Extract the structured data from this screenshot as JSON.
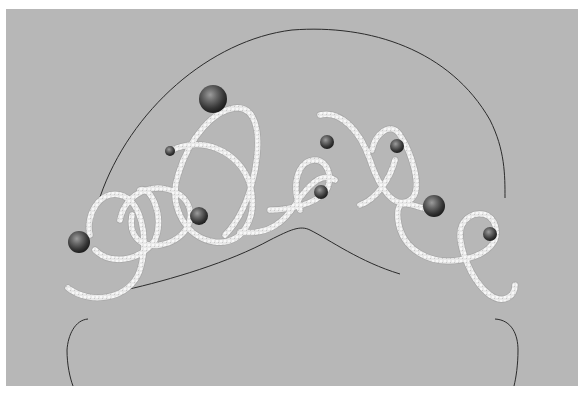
{
  "image": {
    "subject": "tiara illustration",
    "description": "Pearl-studded diamond scroll tiara drawn on a head outline",
    "colors": {
      "page_background": "#ffffff",
      "canvas_background": "#b7b7b7",
      "head_outline": "#2a2a2a",
      "diamond_band": "#e6e6e6",
      "diamond_band_shadow": "#9a9a9a",
      "pearl_dark": "#2e2e2e",
      "pearl_highlight": "#8a8a8a"
    },
    "canvas": {
      "x": 6,
      "y": 9,
      "width": 572,
      "height": 377
    },
    "pearls": [
      {
        "name": "large-top",
        "cx": 213,
        "cy": 99,
        "r": 14
      },
      {
        "name": "small-left-upper",
        "cx": 170,
        "cy": 151,
        "r": 5
      },
      {
        "name": "left-end",
        "cx": 79,
        "cy": 242,
        "r": 11
      },
      {
        "name": "center-left",
        "cx": 199,
        "cy": 216,
        "r": 9
      },
      {
        "name": "center-upper",
        "cx": 327,
        "cy": 142,
        "r": 7
      },
      {
        "name": "right-upper",
        "cx": 397,
        "cy": 146,
        "r": 7
      },
      {
        "name": "center-lower",
        "cx": 321,
        "cy": 192,
        "r": 7
      },
      {
        "name": "right-large",
        "cx": 434,
        "cy": 206,
        "r": 11
      },
      {
        "name": "right-end",
        "cx": 490,
        "cy": 234,
        "r": 7
      }
    ]
  }
}
